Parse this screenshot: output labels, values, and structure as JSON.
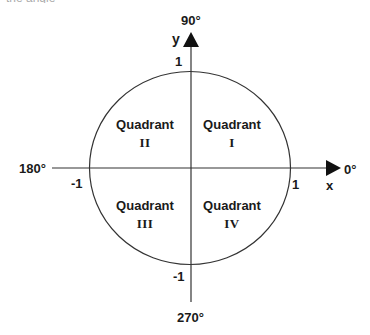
{
  "caption_fragment": "the angle",
  "diagram": {
    "type": "unit-circle-quadrants",
    "colors": {
      "stroke": "#333333",
      "text": "#1a1a1a",
      "background": "#ffffff"
    },
    "axes": {
      "x_label": "x",
      "y_label": "y",
      "angle_0": "0°",
      "angle_90": "90°",
      "angle_180": "180°",
      "angle_270": "270°"
    },
    "ticks": {
      "x_pos": "1",
      "x_neg": "-1",
      "y_pos": "1",
      "y_neg": "-1"
    },
    "quadrants": [
      {
        "word": "Quadrant",
        "numeral": "I"
      },
      {
        "word": "Quadrant",
        "numeral": "II"
      },
      {
        "word": "Quadrant",
        "numeral": "III"
      },
      {
        "word": "Quadrant",
        "numeral": "IV"
      }
    ]
  }
}
